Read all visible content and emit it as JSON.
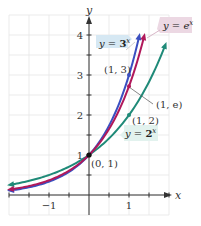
{
  "chart_data": {
    "type": "line",
    "title": "",
    "xlabel": "x",
    "ylabel": "y",
    "xlim": [
      -2,
      2
    ],
    "ylim": [
      -0.5,
      4.5
    ],
    "grid": true,
    "grid_step": 0.5,
    "x_ticks": [
      {
        "value": -1,
        "label": "−1"
      },
      {
        "value": 1,
        "label": "1"
      }
    ],
    "y_ticks": [
      {
        "value": 1,
        "label": "1"
      },
      {
        "value": 2,
        "label": "2"
      },
      {
        "value": 3,
        "label": "3"
      },
      {
        "value": 4,
        "label": "4"
      }
    ],
    "series": [
      {
        "name": "y = 2^x",
        "label": "y = 2ˣ",
        "color": "#1f8a78",
        "function": "2^x",
        "domain": [
          -2,
          2
        ]
      },
      {
        "name": "y = e^x",
        "label": "y = eˣ",
        "color": "#b0185a",
        "function": "e^x",
        "domain": [
          -2,
          1.39
        ]
      },
      {
        "name": "y = 3^x",
        "label": "y = 3ˣ",
        "color": "#3a4fc0",
        "function": "3^x",
        "domain": [
          -2,
          1.26
        ]
      }
    ],
    "annotations": [
      {
        "text": "(0, 1)",
        "x": 0,
        "y": 1
      },
      {
        "text": "(1, 2)",
        "x": 1,
        "y": 2
      },
      {
        "text": "(1, e)",
        "x": 1,
        "y": 2.718
      },
      {
        "text": "(1, 3)",
        "x": 1,
        "y": 3
      }
    ],
    "legend_boxes": [
      {
        "text": "y = 3ˣ",
        "bg": "#d6e8f3"
      },
      {
        "text": "y = eˣ",
        "bg": "#ecd8e3"
      },
      {
        "text": "y = 2ˣ",
        "bg": "#e2f2ee"
      }
    ]
  },
  "labels": {
    "x_axis": "x",
    "y_axis": "y",
    "tick_x_neg1": "−1",
    "tick_x_1": "1",
    "tick_y_1": "1",
    "tick_y_2": "2",
    "tick_y_3": "3",
    "tick_y_4": "4",
    "pt_0_1": "(0, 1)",
    "pt_1_2": "(1, 2)",
    "pt_1_e": "(1, e)",
    "pt_1_3": "(1, 3)",
    "eq_3x_prefix": "y = ",
    "eq_3x_base": "3",
    "eq_3x_exp": "x",
    "eq_ex_prefix": "y = ",
    "eq_ex_base": "e",
    "eq_ex_exp": "x",
    "eq_2x_prefix": "y = ",
    "eq_2x_base": "2",
    "eq_2x_exp": "x"
  }
}
